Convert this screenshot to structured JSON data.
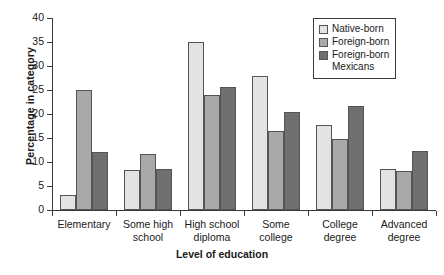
{
  "chart_data": {
    "type": "bar",
    "title": "",
    "xlabel": "Level of education",
    "ylabel": "Percentage in category",
    "ylim": [
      0,
      40
    ],
    "yticks": [
      0,
      5,
      10,
      15,
      20,
      25,
      30,
      35,
      40
    ],
    "grid": false,
    "legend_position": "top-right",
    "categories": [
      "Elementary",
      "Some high\nschool",
      "High school\ndiploma",
      "Some\ncollege",
      "College\ndegree",
      "Advanced\ndegree"
    ],
    "series": [
      {
        "name": "Native-born",
        "color": "#e3e3e3",
        "values": [
          3.2,
          8.3,
          35.0,
          28.0,
          17.8,
          8.6
        ]
      },
      {
        "name": "Foreign-born",
        "color": "#a9a9a9",
        "values": [
          25.0,
          11.6,
          24.0,
          16.5,
          14.7,
          8.1
        ]
      },
      {
        "name": "Foreign-born\nMexicans",
        "color": "#6f6f6f",
        "values": [
          12.0,
          8.5,
          25.7,
          20.5,
          21.6,
          12.3
        ]
      }
    ]
  }
}
